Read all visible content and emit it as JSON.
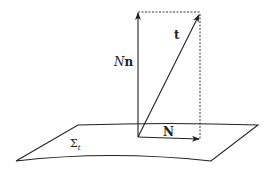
{
  "diagram": {
    "labels": {
      "normal_vector": {
        "prefix": "N",
        "suffix": "n"
      },
      "time_vector": "t",
      "shift_vector": "N",
      "hypersurface": {
        "base": "Σ",
        "subscript": "t"
      }
    },
    "colors": {
      "stroke": "#222222",
      "background": "#ffffff"
    }
  }
}
